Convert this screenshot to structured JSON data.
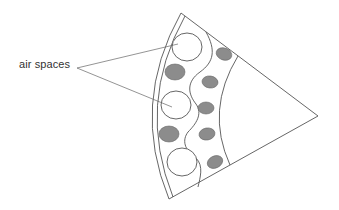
{
  "diagram": {
    "type": "cross-section sector",
    "labels": {
      "air_spaces": "air spaces"
    },
    "colors": {
      "stroke": "#555555",
      "fill_dark": "#8c8c8c",
      "background": "#ffffff",
      "text": "#333333"
    }
  }
}
